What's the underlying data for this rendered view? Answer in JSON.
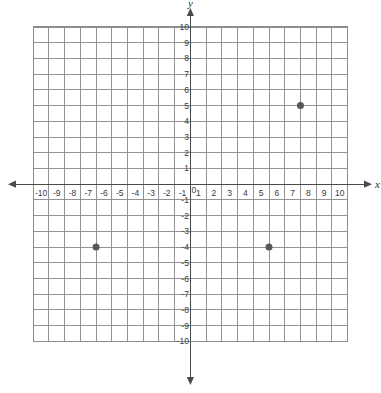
{
  "figure": {
    "kind": "coordinate-plane",
    "background_color": "#ffffff",
    "grid_color": "#8d8d8d",
    "grid_minor_color": "#b9b9b9",
    "axis_color": "#4a4a4a",
    "point_color": "#585858",
    "label_color": "#3a3a3a"
  },
  "axes": {
    "x_name": "x",
    "y_name": "y",
    "origin_label": "0",
    "x_min": -10,
    "x_max": 10,
    "y_min": -10,
    "y_max": 10,
    "step": 1,
    "x_tick_labels": [
      "-10",
      "-9",
      "-8",
      "-7",
      "-6",
      "-5",
      "-4",
      "-3",
      "-2",
      "-1",
      "1",
      "2",
      "3",
      "4",
      "5",
      "6",
      "7",
      "8",
      "9",
      "10"
    ],
    "y_tick_labels": [
      "10",
      "9",
      "8",
      "7",
      "6",
      "5",
      "4",
      "3",
      "2",
      "1",
      "-1",
      "-2",
      "-3",
      "-4",
      "-5",
      "-6",
      "-7",
      "-8",
      "-9",
      "-10"
    ],
    "arrows": [
      "left",
      "right",
      "up",
      "down"
    ]
  },
  "chart_data": {
    "type": "scatter",
    "title": "",
    "xlabel": "x",
    "ylabel": "y",
    "xlim": [
      -10,
      10
    ],
    "ylim": [
      -10,
      10
    ],
    "xticks": [
      -10,
      -9,
      -8,
      -7,
      -6,
      -5,
      -4,
      -3,
      -2,
      -1,
      0,
      1,
      2,
      3,
      4,
      5,
      6,
      7,
      8,
      9,
      10
    ],
    "yticks": [
      -10,
      -9,
      -8,
      -7,
      -6,
      -5,
      -4,
      -3,
      -2,
      -1,
      0,
      1,
      2,
      3,
      4,
      5,
      6,
      7,
      8,
      9,
      10
    ],
    "grid": true,
    "legend": false,
    "series": [
      {
        "name": "plotted points",
        "points": [
          {
            "label": "(7, 5)",
            "x": 7,
            "y": 5
          },
          {
            "label": "(-6, -4)",
            "x": -6,
            "y": -4
          },
          {
            "label": "(5, -4)",
            "x": 5,
            "y": -4
          }
        ]
      }
    ]
  }
}
